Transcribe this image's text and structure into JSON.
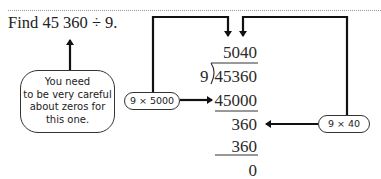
{
  "problem": {
    "question": "Find 45 360 ÷ 9."
  },
  "callout": {
    "lines": [
      "You need",
      "to be very careful",
      "about zeros for",
      "this one."
    ]
  },
  "long_division": {
    "quotient": "5040",
    "divisor": "9",
    "dividend": "45360",
    "steps": [
      {
        "subtract": "45000",
        "annotation": "9 × 5000"
      },
      {
        "remainder": "360",
        "subtract": "360",
        "annotation": "9 × 40"
      }
    ],
    "final_remainder": "0"
  },
  "annotations": {
    "first_label": "9 × 5000",
    "second_label": "9 × 40"
  },
  "colors": {
    "ink": "#222222",
    "rule": "#9a9a9a"
  }
}
